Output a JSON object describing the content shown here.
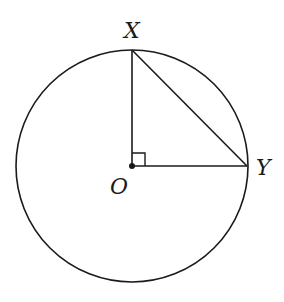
{
  "diagram": {
    "type": "circle-geometry",
    "points": {
      "X": {
        "label": "X",
        "x": 132,
        "y": 48
      },
      "O": {
        "label": "O",
        "x": 132,
        "y": 166
      },
      "Y": {
        "label": "Y",
        "x": 247,
        "y": 166
      }
    },
    "circle": {
      "center": "O",
      "radius": 116
    },
    "segments": [
      "OX",
      "OY",
      "XY"
    ],
    "right_angle_at": "O",
    "colors": {
      "stroke": "#1a1a1a",
      "background": "#ffffff"
    }
  }
}
